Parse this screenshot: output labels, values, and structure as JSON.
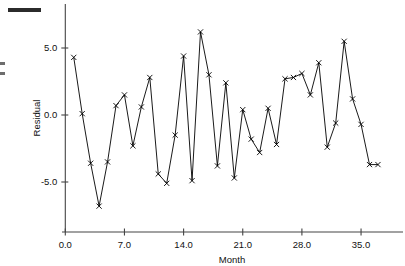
{
  "figure": {
    "name": "residual-plot",
    "background_color": "#ffffff",
    "ink_color": "#000000",
    "axis_color": "#444444",
    "scan_artifacts": [
      {
        "name": "page-edge-mark",
        "label": ""
      },
      {
        "name": "page-edge-fragment",
        "label": ""
      }
    ]
  },
  "chart_data": {
    "type": "line",
    "title": "",
    "xlabel": "Month",
    "ylabel": "Residual",
    "grid": false,
    "legend": null,
    "marker": "x",
    "xlim": [
      0.0,
      38.5
    ],
    "ylim": [
      -8.6,
      7.6
    ],
    "xticks": [
      0.0,
      7.0,
      14.0,
      21.0,
      28.0,
      35.0
    ],
    "xticklabels": [
      "0.0",
      "7.0",
      "14.0",
      "21.0",
      "28.0",
      "35.0"
    ],
    "yticks": [
      -5.0,
      0.0,
      5.0
    ],
    "yticklabels": [
      "-5.0",
      "0.0",
      "5.0"
    ],
    "x": [
      1,
      2,
      3,
      4,
      5,
      6,
      7,
      8,
      9,
      10,
      11,
      12,
      13,
      14,
      15,
      16,
      17,
      18,
      19,
      20,
      21,
      22,
      23,
      24,
      25,
      26,
      27,
      28,
      29,
      30,
      31,
      32,
      33,
      34,
      35,
      36,
      37
    ],
    "values": [
      4.3,
      0.1,
      -3.6,
      -6.8,
      -3.5,
      0.7,
      1.5,
      -2.3,
      0.6,
      2.8,
      -4.4,
      -5.1,
      -1.5,
      4.4,
      -4.9,
      6.2,
      3.0,
      -3.8,
      2.4,
      -4.7,
      0.4,
      -1.8,
      -2.8,
      0.5,
      -2.2,
      2.7,
      2.8,
      3.1,
      1.5,
      3.9,
      -2.4,
      -0.6,
      5.5,
      1.2,
      -0.7,
      -3.7,
      -3.7
    ],
    "series": [
      {
        "name": "Residual",
        "values": [
          4.3,
          0.1,
          -3.6,
          -6.8,
          -3.5,
          0.7,
          1.5,
          -2.3,
          0.6,
          2.8,
          -4.4,
          -5.1,
          -1.5,
          4.4,
          -4.9,
          6.2,
          3.0,
          -3.8,
          2.4,
          -4.7,
          0.4,
          -1.8,
          -2.8,
          0.5,
          -2.2,
          2.7,
          2.8,
          3.1,
          1.5,
          3.9,
          -2.4,
          -0.6,
          5.5,
          1.2,
          -0.7,
          -3.7,
          -3.7
        ]
      }
    ]
  }
}
